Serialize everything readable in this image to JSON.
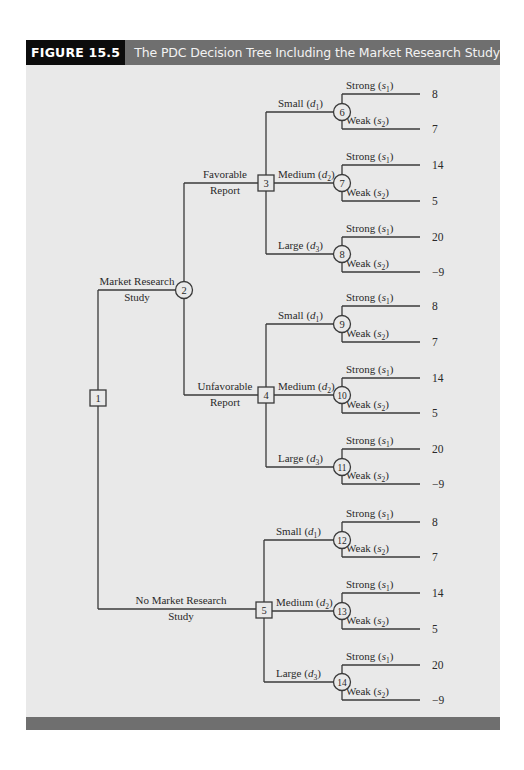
{
  "figure": {
    "label": "FIGURE 15.5",
    "title": "The PDC Decision Tree Including the Market Research Study"
  },
  "colors": {
    "panel_bg": "#e9e9e9",
    "header_bar": "#6f6f6f",
    "label_block": "#0c0c0c",
    "line": "#3a3a3a"
  },
  "tree": {
    "root": {
      "id": "1",
      "type": "decision",
      "x": 98,
      "y": 398
    },
    "study_branches": [
      {
        "label_line1": "Market Research",
        "label_line2": "Study",
        "y": 290,
        "node": {
          "id": "2",
          "type": "chance",
          "x": 184,
          "y": 290
        }
      },
      {
        "label_line1": "No Market Research",
        "label_line2": "Study",
        "y": 609,
        "node": {
          "id": "5",
          "type": "decision",
          "x": 264,
          "y": 610
        }
      }
    ],
    "report_branches": [
      {
        "label_line1": "Favorable",
        "label_line2": "Report",
        "y": 183,
        "node": {
          "id": "3",
          "type": "decision",
          "x": 266,
          "y": 183
        }
      },
      {
        "label_line1": "Unfavorable",
        "label_line2": "Report",
        "y": 395,
        "node": {
          "id": "4",
          "type": "decision",
          "x": 266,
          "y": 395
        }
      }
    ],
    "decision_groups": [
      {
        "parent": "3",
        "alternatives": [
          {
            "label": "Small",
            "sub": "1",
            "node": "6",
            "y": 112,
            "outcomes": [
              {
                "label": "Strong",
                "sub": "1",
                "payoff": "8",
                "y": 94
              },
              {
                "label": "Weak",
                "sub": "2",
                "payoff": "7",
                "y": 129
              }
            ]
          },
          {
            "label": "Medium",
            "sub": "2",
            "node": "7",
            "y": 183,
            "outcomes": [
              {
                "label": "Strong",
                "sub": "1",
                "payoff": "14",
                "y": 165
              },
              {
                "label": "Weak",
                "sub": "2",
                "payoff": "5",
                "y": 201
              }
            ]
          },
          {
            "label": "Large",
            "sub": "3",
            "node": "8",
            "y": 254,
            "outcomes": [
              {
                "label": "Strong",
                "sub": "1",
                "payoff": "20",
                "y": 237
              },
              {
                "label": "Weak",
                "sub": "2",
                "payoff": "−9",
                "y": 272
              }
            ]
          }
        ]
      },
      {
        "parent": "4",
        "alternatives": [
          {
            "label": "Small",
            "sub": "1",
            "node": "9",
            "y": 324,
            "outcomes": [
              {
                "label": "Strong",
                "sub": "1",
                "payoff": "8",
                "y": 306
              },
              {
                "label": "Weak",
                "sub": "2",
                "payoff": "7",
                "y": 342
              }
            ]
          },
          {
            "label": "Medium",
            "sub": "2",
            "node": "10",
            "y": 395,
            "outcomes": [
              {
                "label": "Strong",
                "sub": "1",
                "payoff": "14",
                "y": 378
              },
              {
                "label": "Weak",
                "sub": "2",
                "payoff": "5",
                "y": 413
              }
            ]
          },
          {
            "label": "Large",
            "sub": "3",
            "node": "11",
            "y": 467,
            "outcomes": [
              {
                "label": "Strong",
                "sub": "1",
                "payoff": "20",
                "y": 449
              },
              {
                "label": "Weak",
                "sub": "2",
                "payoff": "−9",
                "y": 484
              }
            ]
          }
        ]
      },
      {
        "parent": "5",
        "alternatives": [
          {
            "label": "Small",
            "sub": "1",
            "node": "12",
            "y": 540,
            "outcomes": [
              {
                "label": "Strong",
                "sub": "1",
                "payoff": "8",
                "y": 522
              },
              {
                "label": "Weak",
                "sub": "2",
                "payoff": "7",
                "y": 557
              }
            ]
          },
          {
            "label": "Medium",
            "sub": "2",
            "node": "13",
            "y": 611,
            "outcomes": [
              {
                "label": "Strong",
                "sub": "1",
                "payoff": "14",
                "y": 593
              },
              {
                "label": "Weak",
                "sub": "2",
                "payoff": "5",
                "y": 629
              }
            ]
          },
          {
            "label": "Large",
            "sub": "3",
            "node": "14",
            "y": 682,
            "outcomes": [
              {
                "label": "Strong",
                "sub": "1",
                "payoff": "20",
                "y": 665
              },
              {
                "label": "Weak",
                "sub": "2",
                "payoff": "−9",
                "y": 700
              }
            ]
          }
        ]
      }
    ],
    "chance_node_x": 342,
    "leaf_end_x": 420,
    "payoff_x": 432
  }
}
